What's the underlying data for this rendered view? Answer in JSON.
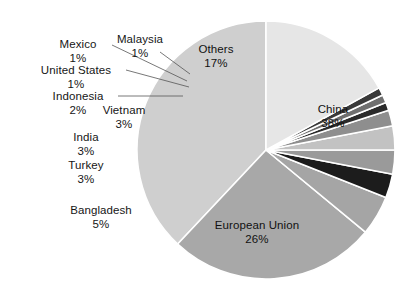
{
  "chart_data": {
    "type": "pie",
    "title": "",
    "subtitle": "",
    "xlabel": "",
    "ylabel": "",
    "legend_position": "none",
    "grid": false,
    "units": "percent",
    "total": 100,
    "start_angle_deg": 0,
    "direction": "counterclockwise",
    "categories": [
      "China",
      "European Union",
      "Bangladesh",
      "Turkey",
      "India",
      "Vietnam",
      "Indonesia",
      "United States",
      "Mexico",
      "Malaysia",
      "Others"
    ],
    "values": [
      38,
      26,
      5,
      3,
      3,
      3,
      2,
      1,
      1,
      1,
      17
    ],
    "slices": [
      {
        "label": "China",
        "value": 38,
        "pct_text": "38%",
        "color": "#cfcfcf",
        "label_placement": "inside"
      },
      {
        "label": "European Union",
        "value": 26,
        "pct_text": "26%",
        "color": "#a8a8a8",
        "label_placement": "inside"
      },
      {
        "label": "Bangladesh",
        "value": 5,
        "pct_text": "5%",
        "color": "#a5a5a5",
        "label_placement": "callout"
      },
      {
        "label": "Turkey",
        "value": 3,
        "pct_text": "3%",
        "color": "#1c1c1c",
        "label_placement": "callout"
      },
      {
        "label": "India",
        "value": 3,
        "pct_text": "3%",
        "color": "#9a9a9a",
        "label_placement": "callout"
      },
      {
        "label": "Vietnam",
        "value": 3,
        "pct_text": "3%",
        "color": "#c2c2c2",
        "label_placement": "callout"
      },
      {
        "label": "Indonesia",
        "value": 2,
        "pct_text": "2%",
        "color": "#8e8e8e",
        "label_placement": "callout"
      },
      {
        "label": "United States",
        "value": 1,
        "pct_text": "1%",
        "color": "#2a2a2a",
        "label_placement": "callout"
      },
      {
        "label": "Mexico",
        "value": 1,
        "pct_text": "1%",
        "color": "#6f6f6f",
        "label_placement": "callout"
      },
      {
        "label": "Malaysia",
        "value": 1,
        "pct_text": "1%",
        "color": "#3a3a3a",
        "label_placement": "callout"
      },
      {
        "label": "Others",
        "value": 17,
        "pct_text": "17%",
        "color": "#e6e6e6",
        "label_placement": "inside"
      }
    ]
  },
  "colors": {
    "background": "#ffffff",
    "slice_separator": "#ffffff",
    "leader_line": "#555555",
    "text": "#161616"
  }
}
